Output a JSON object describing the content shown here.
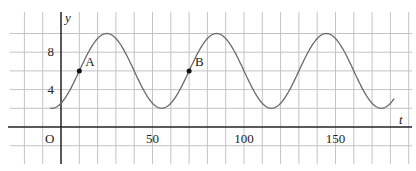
{
  "chart_data": {
    "type": "line",
    "title": "",
    "xlabel": "t",
    "ylabel": "y",
    "origin_label": "O",
    "x_ticks": [
      50,
      100,
      150
    ],
    "y_ticks": [
      4,
      8
    ],
    "xlim": [
      -20,
      190
    ],
    "ylim": [
      -2,
      12
    ],
    "grid": true,
    "x_grid_step": 10,
    "y_grid_step": 2,
    "function": "y = 6 + 4 sin(2π(t - 10)/60)",
    "series": [
      {
        "name": "curve",
        "x": [
          -6,
          10,
          25,
          40,
          55,
          70,
          85,
          100,
          115,
          130,
          145,
          160,
          175,
          182
        ],
        "values": [
          2.5,
          6,
          10,
          6,
          2,
          6,
          10,
          6,
          2,
          6,
          10,
          6,
          2,
          3.7
        ]
      }
    ],
    "points": [
      {
        "label": "A",
        "t": 10,
        "y": 6
      },
      {
        "label": "B",
        "t": 70,
        "y": 6
      }
    ],
    "colors": {
      "curve": "#666666",
      "grid": "#bdbdbd",
      "axis": "#222222"
    }
  }
}
